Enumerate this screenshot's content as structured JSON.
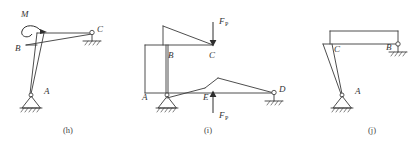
{
  "sheet": {
    "title": "Structural frame diagrams (h), (i), (j)",
    "background_color": "#ffffff",
    "line_color": "#3a3a3a",
    "label_color": "#333333"
  },
  "figures": [
    {
      "id": "fig-h",
      "caption": "(h)",
      "description": "Bent frame with applied couple M at B, pin support at A and link/pin support at C",
      "joints": [
        {
          "name": "M",
          "label": "M",
          "kind": "moment-load"
        },
        {
          "name": "B",
          "label": "B",
          "kind": "joint"
        },
        {
          "name": "C",
          "label": "C",
          "kind": "pin-support"
        },
        {
          "name": "A",
          "label": "A",
          "kind": "pin-support"
        }
      ],
      "loads": [
        {
          "name": "M",
          "label": "M",
          "type": "couple",
          "sense": "clockwise",
          "at": "B"
        }
      ],
      "supports": [
        {
          "at": "A",
          "type": "hinged-triangle-with-hatching"
        },
        {
          "at": "C",
          "type": "pin-on-stub-with-hatching"
        }
      ]
    },
    {
      "id": "fig-i",
      "caption": "(i)",
      "description": "Two-tier frame with downward force FP at C and upward force FP at E, pin support at A and pin support at D",
      "joints": [
        {
          "name": "B",
          "label": "B",
          "kind": "joint"
        },
        {
          "name": "C",
          "label": "C",
          "kind": "joint"
        },
        {
          "name": "A",
          "label": "A",
          "kind": "pin-support"
        },
        {
          "name": "E",
          "label": "E",
          "kind": "joint"
        },
        {
          "name": "D",
          "label": "D",
          "kind": "pin-support"
        }
      ],
      "loads": [
        {
          "name": "FP-top",
          "label": "F",
          "subscript": "P",
          "type": "force",
          "direction": "down",
          "at": "C"
        },
        {
          "name": "FP-bottom",
          "label": "F",
          "subscript": "P",
          "type": "force",
          "direction": "up",
          "at": "E"
        }
      ],
      "supports": [
        {
          "at": "A",
          "type": "hinged-triangle-with-hatching"
        },
        {
          "at": "D",
          "type": "pin-on-stub-with-hatching"
        }
      ]
    },
    {
      "id": "fig-j",
      "caption": "(j)",
      "description": "Bent frame with pin support at A and pin support at B, joint C on the column",
      "joints": [
        {
          "name": "C",
          "label": "C",
          "kind": "joint"
        },
        {
          "name": "B",
          "label": "B",
          "kind": "pin-support"
        },
        {
          "name": "A",
          "label": "A",
          "kind": "pin-support"
        }
      ],
      "loads": [],
      "supports": [
        {
          "at": "A",
          "type": "hinged-triangle-with-hatching"
        },
        {
          "at": "B",
          "type": "pin-on-stub-with-hatching"
        }
      ]
    }
  ]
}
